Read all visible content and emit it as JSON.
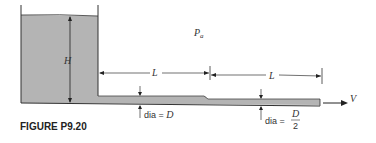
{
  "figure": {
    "caption": "FIGURE P9.20",
    "labels": {
      "ambient_pressure": "P",
      "ambient_pressure_sub": "a",
      "height": "H",
      "length_1": "L",
      "length_2": "L",
      "velocity": "V",
      "dia_1_prefix": "dia = ",
      "dia_1_value": "D",
      "dia_2_prefix": "dia = ",
      "dia_2_num": "D",
      "dia_2_den": "2"
    },
    "colors": {
      "fluid": "#b4b4b4",
      "line": "#333333"
    }
  }
}
